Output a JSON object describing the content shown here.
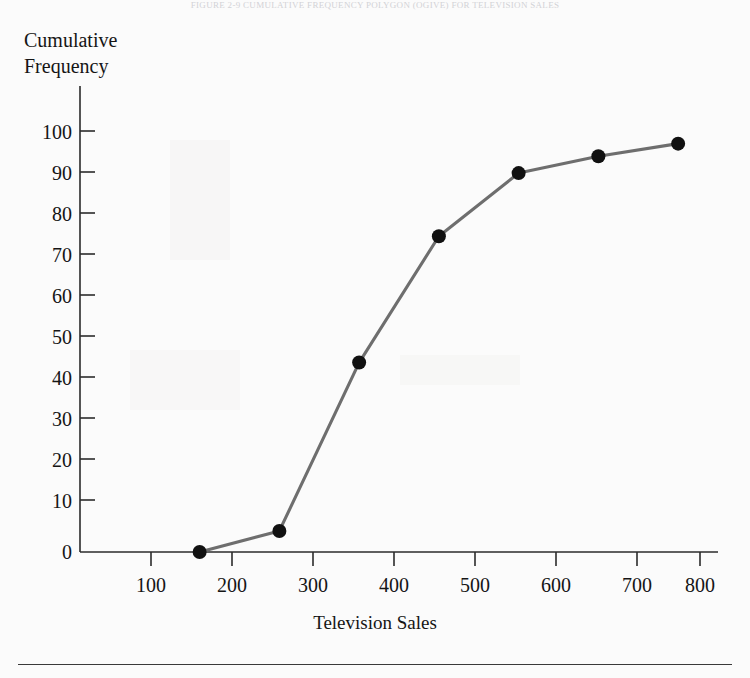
{
  "page": {
    "running_head": "FIGURE 2-9   CUMULATIVE FREQUENCY POLYGON (OGIVE) FOR TELEVISION SALES"
  },
  "chart_data": {
    "type": "line",
    "title": "",
    "xlabel": "Television Sales",
    "ylabel": "Cumulative\nFrequency",
    "x": [
      200,
      300,
      400,
      500,
      600,
      700,
      800
    ],
    "values": [
      0,
      5,
      45,
      75,
      90,
      94,
      97
    ],
    "series": [
      {
        "name": "Cumulative Frequency",
        "values": [
          0,
          5,
          45,
          75,
          90,
          94,
          97
        ]
      }
    ],
    "xlim": [
      50,
      850
    ],
    "ylim": [
      0,
      103
    ],
    "x_ticks": [
      100,
      200,
      300,
      400,
      500,
      600,
      700,
      800
    ],
    "y_ticks": [
      0,
      10,
      20,
      30,
      40,
      50,
      60,
      70,
      80,
      90,
      100
    ],
    "x_tick_labels": [
      "100",
      "200",
      "300",
      "400",
      "500",
      "600",
      "700",
      "800"
    ],
    "y_tick_labels": [
      "0",
      "10",
      "20",
      "30",
      "40",
      "50",
      "60",
      "70",
      "80",
      "90",
      "100"
    ],
    "grid": false,
    "legend": false,
    "legend_position": "none",
    "marker": "circle",
    "line_color": "#6e6e6e",
    "marker_color": "#111111",
    "axis_color": "#2b2b2b",
    "background_color": "#fbfbfb"
  }
}
